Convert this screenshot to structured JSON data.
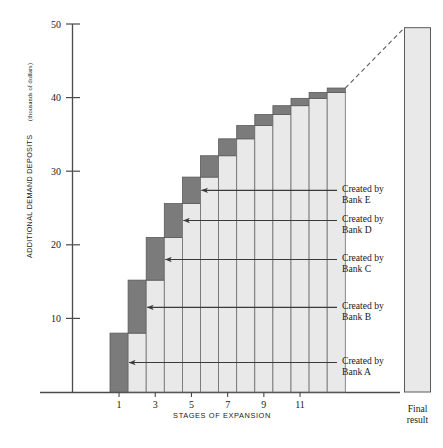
{
  "chart_data": {
    "type": "bar",
    "title": "",
    "subtitle": "",
    "xlabel": "STAGES OF EXPANSION",
    "ylabel": "ADDITIONAL DEMAND DEPOSITS",
    "ylabel_units": "(thousands of dollars)",
    "ylim": [
      0,
      50
    ],
    "y_ticks": [
      10,
      20,
      30,
      40,
      50
    ],
    "x_ticks": [
      1,
      3,
      5,
      7,
      9,
      11
    ],
    "grid": false,
    "legend_position": "right-inline-annotations",
    "categories": [
      1,
      2,
      3,
      4,
      5,
      6,
      7,
      8,
      9,
      10,
      11,
      12,
      13
    ],
    "series": [
      {
        "name": "Carried over from previous stage",
        "color": "#e9e9e9",
        "values": [
          0,
          8.0,
          15.2,
          21.0,
          25.6,
          29.2,
          32.1,
          34.4,
          36.2,
          37.7,
          38.9,
          39.9,
          40.7
        ]
      },
      {
        "name": "Created at this stage",
        "color": "#7b7b7b",
        "values": [
          8.0,
          7.2,
          5.8,
          4.6,
          3.6,
          2.9,
          2.3,
          1.8,
          1.5,
          1.2,
          1.0,
          0.8,
          0.6
        ]
      }
    ],
    "cumulative_totals": [
      8.0,
      15.2,
      21.0,
      25.6,
      29.2,
      32.1,
      34.4,
      36.2,
      37.7,
      38.9,
      39.9,
      40.7,
      41.3
    ],
    "final_result": {
      "label_line1": "Final",
      "label_line2": "result",
      "value": 49.5
    },
    "connector": {
      "style": "dashed",
      "from_stage": 13,
      "to": "final_result"
    },
    "annotations": [
      {
        "id": "bank-a",
        "line1": "Created by",
        "line2": "Bank A",
        "target_stage": 1,
        "target_value": 4.0
      },
      {
        "id": "bank-b",
        "line1": "Created by",
        "line2": "Bank B",
        "target_stage": 2,
        "target_value": 11.5
      },
      {
        "id": "bank-c",
        "line1": "Created by",
        "line2": "Bank C",
        "target_stage": 3,
        "target_value": 18.0
      },
      {
        "id": "bank-d",
        "line1": "Created by",
        "line2": "Bank D",
        "target_stage": 4,
        "target_value": 23.3
      },
      {
        "id": "bank-e",
        "line1": "Created by",
        "line2": "Bank E",
        "target_stage": 5,
        "target_value": 27.4
      }
    ]
  },
  "axis": {
    "y_tick_labels": [
      "50",
      "40",
      "30",
      "20",
      "10"
    ],
    "x_tick_labels": [
      "1",
      "3",
      "5",
      "7",
      "9",
      "11"
    ]
  },
  "colors": {
    "created_segment": "#7b7b7b",
    "carried_segment": "#e9e9e9",
    "final_bar": "#e9e9e9",
    "axis": "#4a4a4a",
    "text": "#1a1a1a"
  }
}
